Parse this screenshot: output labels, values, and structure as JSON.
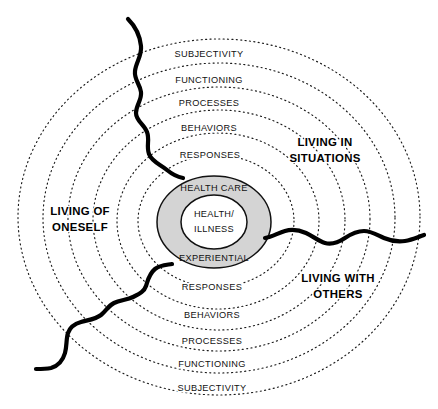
{
  "diagram": {
    "core": {
      "inner_line1": "HEALTH/",
      "inner_line2": "ILLNESS",
      "top_label": "HEALTH CARE",
      "bottom_label": "EXPERIENTIAL",
      "fill_color": "#d4d4d4",
      "inner_fill_color": "#ffffff",
      "stroke_color": "#111111"
    },
    "rings_top": [
      {
        "label": "SUBJECTIVITY",
        "index": 5
      },
      {
        "label": "FUNCTIONING",
        "index": 4
      },
      {
        "label": "PROCESSES",
        "index": 3
      },
      {
        "label": "BEHAVIORS",
        "index": 2
      },
      {
        "label": "RESPONSES",
        "index": 1
      }
    ],
    "rings_bottom": [
      {
        "label": "RESPONSES",
        "index": 1
      },
      {
        "label": "BEHAVIORS",
        "index": 2
      },
      {
        "label": "PROCESSES",
        "index": 3
      },
      {
        "label": "FUNCTIONING",
        "index": 4
      },
      {
        "label": "SUBJECTIVITY",
        "index": 5
      }
    ],
    "domains": [
      {
        "id": "living-of-oneself",
        "line1": "LIVING OF",
        "line2": "ONESELF",
        "x": 80,
        "y": 217
      },
      {
        "id": "living-in-situations",
        "line1": "LIVING IN",
        "line2": "SITUATIONS",
        "x": 325,
        "y": 148
      },
      {
        "id": "living-with-others",
        "line1": "LIVING WITH",
        "line2": "OTHERS",
        "x": 338,
        "y": 284
      }
    ],
    "wave": {
      "color": "#000000",
      "stroke_width": 4.2,
      "description": "irregular hand-drawn boundary line crossing the rings"
    },
    "ring_style": {
      "stroke_color": "#1a1a1a",
      "dash": "dotted"
    }
  }
}
